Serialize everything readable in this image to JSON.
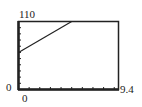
{
  "labels": {
    "ymax": "110",
    "ymin": "0",
    "xmin": "0",
    "xmax": "9.4"
  },
  "chart_data": {
    "type": "line",
    "title": "",
    "xlabel": "",
    "ylabel": "",
    "xlim": [
      0,
      9.4
    ],
    "ylim": [
      0,
      110
    ],
    "xscale_ticks": 1,
    "yscale_ticks": 10,
    "grid": false,
    "series": [
      {
        "name": "y = 60 + 10x",
        "x": [
          0,
          5
        ],
        "y": [
          60,
          110
        ]
      }
    ]
  }
}
